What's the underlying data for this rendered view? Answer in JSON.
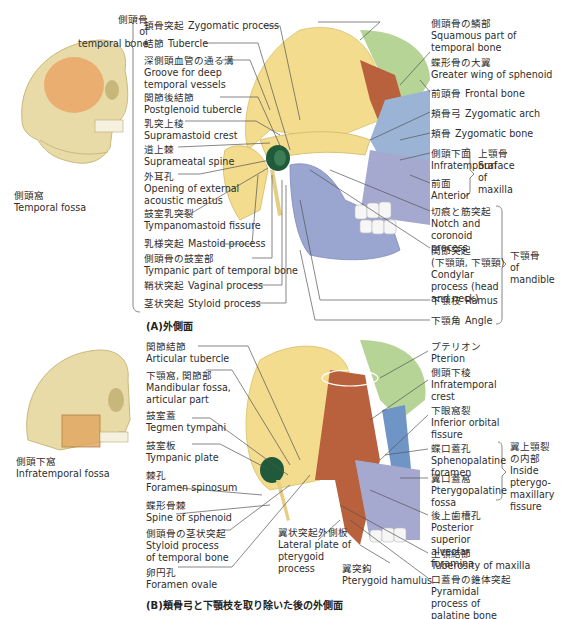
{
  "panel_a": {
    "caption": "(A)外側面",
    "temporal_bone_group": {
      "jp": "側頭骨",
      "en1": "of",
      "en2": "temporal bone"
    },
    "temporal_fossa": {
      "jp": "側頭窩",
      "en": "Temporal fossa"
    },
    "left_labels": [
      {
        "jp": "頬骨突起",
        "en": "Zygomatic process",
        "inline": true
      },
      {
        "jp": "結節",
        "en": "Tubercle",
        "inline": true
      },
      {
        "jp": "深側頭血管の通る溝",
        "en": "Groove for deep temporal vessels"
      },
      {
        "jp": "関節後結節",
        "en": "Postglenoid tubercle"
      },
      {
        "jp": "乳突上稜",
        "en": "Supramastoid crest"
      },
      {
        "jp": "道上棘",
        "en": "Suprameatal spine"
      },
      {
        "jp": "外耳孔",
        "en": "Opening of external acoustic meatus"
      },
      {
        "jp": "鼓室乳突裂",
        "en": "Tympanomastoid fissure"
      },
      {
        "jp": "乳様突起",
        "en": "Mastoid process",
        "inline": true
      },
      {
        "jp": "側頭骨の鼓室部",
        "en": "Tympanic part of temporal bone"
      },
      {
        "jp": "鞘状突起",
        "en": "Vaginal process",
        "inline": true
      },
      {
        "jp": "茎状突起",
        "en": "Styloid process",
        "inline": true
      }
    ],
    "right_labels": [
      {
        "jp": "側頭骨の鱗部",
        "en": "Squamous part of temporal bone"
      },
      {
        "jp": "蝶形骨の大翼",
        "en": "Greater wing of sphenoid"
      },
      {
        "jp": "前頭骨",
        "en": "Frontal bone",
        "inline": true
      },
      {
        "jp": "頬骨弓",
        "en": "Zygomatic arch",
        "inline": true
      },
      {
        "jp": "頬骨",
        "en": "Zygomatic bone",
        "inline": true
      },
      {
        "jp": "側頭下面",
        "en": "Infratemporal"
      },
      {
        "jp": "前面",
        "en": "Anterior"
      },
      {
        "jp": "切痕と筋突起",
        "en": "Notch and coronoid process"
      },
      {
        "jp": "関節突起",
        "jp2": "(下顎頭, 下顎頸)",
        "en": "Condylar process (head and neck)"
      },
      {
        "jp": "下顎枝",
        "en": "Ramus",
        "inline": true
      },
      {
        "jp": "下顎角",
        "en": "Angle",
        "inline": true
      }
    ],
    "maxilla_group": {
      "jp": "上顎骨",
      "en1": "Surface",
      "en2": "of",
      "en3": "maxilla"
    },
    "mandible_group": {
      "jp": "下顎骨",
      "en1": "of",
      "en2": "mandible"
    }
  },
  "panel_b": {
    "caption": "(B)頬骨弓と下顎枝を取り除いた後の外側面",
    "infratemporal_fossa": {
      "jp": "側頭下窩",
      "en": "Infratemporal fossa"
    },
    "left_labels": [
      {
        "jp": "関節結節",
        "en": "Articular tubercle"
      },
      {
        "jp": "下顎窩, 関節部",
        "en": "Mandibular fossa, articular part"
      },
      {
        "jp": "鼓室蓋",
        "en": "Tegmen tympani"
      },
      {
        "jp": "鼓室板",
        "en": "Tympanic plate"
      },
      {
        "jp": "棘孔",
        "en": "Foramen spinosum"
      },
      {
        "jp": "蝶形骨棘",
        "en": "Spine of sphenoid"
      },
      {
        "jp": "側頭骨の茎状突起",
        "en": "Styloid process of temporal bone"
      },
      {
        "jp": "卵円孔",
        "en": "Foramen ovale"
      }
    ],
    "bottom_labels": [
      {
        "jp": "翼状突起外側板",
        "en": "Lateral plate of pterygoid process"
      },
      {
        "jp": "翼突鈎",
        "en": "Pterygoid hamulus"
      }
    ],
    "right_labels": [
      {
        "jp": "プテリオン",
        "en": "Pterion"
      },
      {
        "jp": "側頭下稜",
        "en": "Infratemporal crest"
      },
      {
        "jp": "下眼窩裂",
        "en": "Inferior orbital fissure"
      },
      {
        "jp": "蝶口蓋孔",
        "en": "Sphenopalatine foramen"
      },
      {
        "jp": "翼口蓋窩",
        "en": "Pterygopalatine fossa"
      },
      {
        "jp": "後上歯槽孔",
        "en": "Posterior superior alveolar foramina"
      },
      {
        "jp": "上顎結節",
        "en": "Tuberosity of maxilla"
      },
      {
        "jp": "口蓋骨の錐体突起",
        "en": "Pyramidal process of palatine bone"
      }
    ],
    "pterygomaxillary_group": {
      "jp1": "翼上顎裂",
      "jp2": "の内部",
      "en1": "Inside",
      "en2": "pterygo-",
      "en3": "maxillary",
      "en4": "fissure"
    }
  },
  "colors": {
    "temporal_bone": "#f3dc8e",
    "sphenoid": "#b8613c",
    "frontal": "#b5d495",
    "zygomatic": "#9bb4d6",
    "mandible": "#9aa6d0",
    "maxilla": "#a5a9cf",
    "tympanic": "#1f5a3a",
    "skull_bone": "#e8dba7",
    "temporal_fossa": "#eba96b",
    "leader": "#555555"
  }
}
